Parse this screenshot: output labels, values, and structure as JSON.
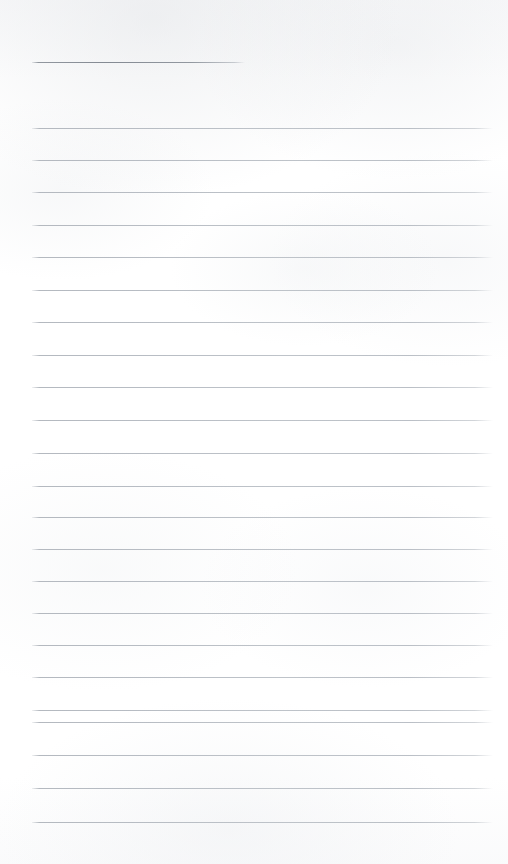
{
  "page": {
    "kind": "scanned-blank-lined-notepad-page",
    "width": 508,
    "height": 864,
    "background_color": "#ffffff",
    "has_text_content": false,
    "visible_text": "",
    "line_color": "#bcc1c7",
    "header_line_color": "#878d96"
  },
  "rules": {
    "count": 24,
    "left_x": 32,
    "right_x": 493,
    "spacing_px": 31.6,
    "header": {
      "y": 62,
      "left_x": 32,
      "right_x": 245,
      "length_px": 213
    },
    "body_lines": [
      {
        "y": 128,
        "left_x": 32,
        "right_x": 493
      },
      {
        "y": 160,
        "left_x": 32,
        "right_x": 493
      },
      {
        "y": 192,
        "left_x": 32,
        "right_x": 493
      },
      {
        "y": 225,
        "left_x": 32,
        "right_x": 493
      },
      {
        "y": 257,
        "left_x": 32,
        "right_x": 493
      },
      {
        "y": 290,
        "left_x": 32,
        "right_x": 493
      },
      {
        "y": 322,
        "left_x": 32,
        "right_x": 493
      },
      {
        "y": 355,
        "left_x": 32,
        "right_x": 493
      },
      {
        "y": 387,
        "left_x": 32,
        "right_x": 493
      },
      {
        "y": 420,
        "left_x": 32,
        "right_x": 493
      },
      {
        "y": 453,
        "left_x": 32,
        "right_x": 493
      },
      {
        "y": 486,
        "left_x": 32,
        "right_x": 493
      },
      {
        "y": 517,
        "left_x": 32,
        "right_x": 493
      },
      {
        "y": 549,
        "left_x": 32,
        "right_x": 493
      },
      {
        "y": 581,
        "left_x": 32,
        "right_x": 493
      },
      {
        "y": 613,
        "left_x": 32,
        "right_x": 493
      },
      {
        "y": 645,
        "left_x": 32,
        "right_x": 493
      },
      {
        "y": 677,
        "left_x": 32,
        "right_x": 493
      },
      {
        "y": 710,
        "left_x": 32,
        "right_x": 493
      },
      {
        "y": 722,
        "left_x": 32,
        "right_x": 493
      },
      {
        "y": 755,
        "left_x": 32,
        "right_x": 493
      },
      {
        "y": 788,
        "left_x": 32,
        "right_x": 493
      },
      {
        "y": 822,
        "left_x": 32,
        "right_x": 493
      }
    ]
  }
}
